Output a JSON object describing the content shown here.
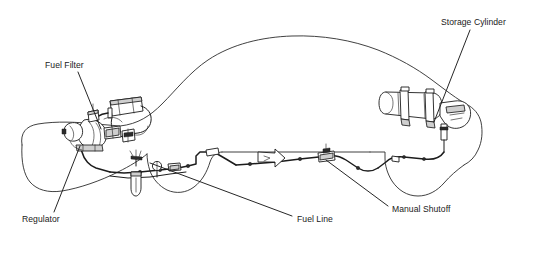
{
  "diagram": {
    "type": "technical-line-drawing",
    "background_color": "#ffffff",
    "line_color": "#1c1c1c",
    "labels": [
      {
        "id": "fuel-filter",
        "text": "Fuel Filter",
        "text_x": 45,
        "text_y": 68,
        "leader": "M 78 72 L 101 129",
        "description": "Rectangular inline fuel filter canister mounted in the engine compartment"
      },
      {
        "id": "storage-cylinder",
        "text": "Storage Cylinder",
        "text_x": 441,
        "text_y": 25,
        "leader": "M 470 30 L 434 122",
        "description": "Horizontal high-pressure CNG storage cylinder with two mounting straps at the rear of the vehicle"
      },
      {
        "id": "regulator",
        "text": "Regulator",
        "text_x": 22,
        "text_y": 222,
        "leader": "M 54 212 L 80 146",
        "description": "Pressure regulator assembly at the front of the fuel line in the engine bay"
      },
      {
        "id": "fuel-line",
        "text": "Fuel Line",
        "text_x": 297,
        "text_y": 222,
        "leader": "M 292 216 L 150 163",
        "description": "High-pressure fuel line running the length of the chassis from cylinder to regulator"
      },
      {
        "id": "manual-shutoff",
        "text": "Manual Shutoff",
        "text_x": 392,
        "text_y": 212,
        "leader": "M 388 206 L 326 160",
        "description": "Manual shutoff valve block mounted inline on the fuel line beneath the floor"
      }
    ],
    "components": {
      "vehicle_outline": "Side profile silhouette of a passenger sedan facing left, with front and rear wheel arch cutouts",
      "flow_arrow": "Hollow arrow symbol on the fuel line indicating direction of gas flow toward the engine",
      "inline_fittings": 9,
      "cylinder_straps": 2
    }
  }
}
